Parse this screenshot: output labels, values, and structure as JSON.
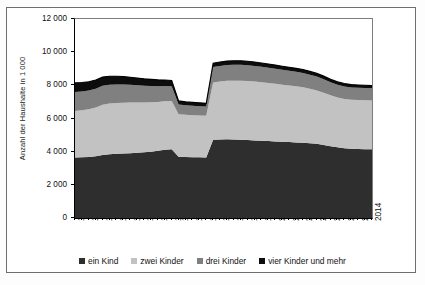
{
  "chart_data": {
    "type": "area",
    "stacked": true,
    "title": "",
    "subtitle": "",
    "xlabel": "",
    "ylabel": "Anzahl der Haushalte in 1 000",
    "ylim": [
      0,
      12000
    ],
    "ytick_values": [
      0,
      2000,
      4000,
      6000,
      8000,
      10000,
      12000
    ],
    "ytick_labels": [
      "0",
      "2 000",
      "4 000",
      "6 000",
      "8 000",
      "10 000",
      "12 000"
    ],
    "grid": false,
    "legend_position": "bottom",
    "x": [
      1968,
      1969,
      1970,
      1971,
      1972,
      1973,
      1974,
      1975,
      1976,
      1977,
      1978,
      1979,
      1980,
      1981,
      1982,
      1986,
      1987,
      1988,
      1989,
      1990,
      1991,
      1992,
      1993,
      1994,
      1995,
      1996,
      1997,
      1998,
      1999,
      2000,
      2001,
      2002,
      2003,
      2004,
      2005,
      2006,
      2007,
      2008,
      2009,
      2010,
      2011,
      2012,
      2013,
      2014
    ],
    "xtick_labels": [
      "1968",
      "1970",
      "1972",
      "1974",
      "1976",
      "1978",
      "1980",
      "1982",
      "1986",
      "1988",
      "1990",
      "1992",
      "1994",
      "1996",
      "1998",
      "2000",
      "2002",
      "2004",
      "2006",
      "2008",
      "2010",
      "2012",
      "2014"
    ],
    "series": [
      {
        "name": "ein Kind",
        "color": "#2e2e2e",
        "values": [
          3650,
          3660,
          3680,
          3720,
          3800,
          3840,
          3870,
          3890,
          3910,
          3930,
          3960,
          4000,
          4050,
          4120,
          4150,
          3700,
          3680,
          3670,
          3660,
          3650,
          4720,
          4740,
          4750,
          4740,
          4720,
          4700,
          4680,
          4660,
          4640,
          4620,
          4600,
          4580,
          4560,
          4540,
          4510,
          4470,
          4400,
          4330,
          4260,
          4200,
          4170,
          4160,
          4150,
          4140
        ]
      },
      {
        "name": "zwei Kinder",
        "color": "#c2c2c2",
        "values": [
          2800,
          2830,
          2880,
          2950,
          3030,
          3060,
          3060,
          3060,
          3050,
          3030,
          3000,
          2980,
          2950,
          2920,
          2900,
          2560,
          2540,
          2530,
          2520,
          2510,
          3450,
          3490,
          3520,
          3540,
          3560,
          3560,
          3550,
          3530,
          3500,
          3470,
          3440,
          3410,
          3380,
          3340,
          3280,
          3220,
          3150,
          3070,
          3010,
          2980,
          2960,
          2950,
          2950,
          2950
        ]
      },
      {
        "name": "drei Kinder",
        "color": "#808080",
        "values": [
          1150,
          1140,
          1130,
          1130,
          1150,
          1140,
          1120,
          1100,
          1070,
          1040,
          1010,
          980,
          950,
          920,
          900,
          590,
          580,
          570,
          565,
          560,
          930,
          940,
          950,
          960,
          960,
          950,
          940,
          930,
          920,
          910,
          900,
          890,
          880,
          870,
          855,
          840,
          820,
          790,
          770,
          755,
          745,
          740,
          735,
          730
        ]
      },
      {
        "name": "vier Kinder und mehr",
        "color": "#0d0d0d",
        "values": [
          560,
          545,
          530,
          520,
          515,
          505,
          495,
          480,
          460,
          440,
          420,
          400,
          380,
          360,
          340,
          210,
          205,
          200,
          198,
          195,
          230,
          235,
          240,
          245,
          245,
          240,
          235,
          230,
          225,
          220,
          215,
          210,
          205,
          200,
          195,
          190,
          185,
          180,
          175,
          172,
          170,
          168,
          166,
          165
        ]
      }
    ]
  },
  "legend": {
    "items": [
      {
        "label": "ein Kind",
        "color": "#2e2e2e"
      },
      {
        "label": "zwei Kinder",
        "color": "#c2c2c2"
      },
      {
        "label": "drei Kinder",
        "color": "#808080"
      },
      {
        "label": "vier Kinder und mehr",
        "color": "#0d0d0d"
      }
    ]
  },
  "axes": {
    "y_title": "Anzahl der Haushalte in 1 000"
  }
}
